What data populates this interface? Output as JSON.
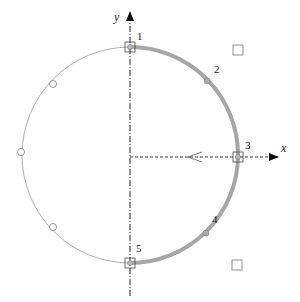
{
  "diagram": {
    "axes": {
      "x_label": "x",
      "y_label": "y"
    },
    "circle": {
      "cx": 130,
      "cy": 155,
      "r": 108,
      "stroke": "#999999",
      "highlight_stroke": "#a6a6a6"
    },
    "points": [
      {
        "label": "1",
        "x": 130,
        "y": 22
      },
      {
        "label": "2",
        "x": 207,
        "y": 79
      },
      {
        "label": "3",
        "x": 238,
        "y": 157
      },
      {
        "label": "4",
        "x": 206,
        "y": 232
      },
      {
        "label": "5",
        "x": 130,
        "y": 262
      }
    ],
    "open_circles": [
      {
        "x": 53,
        "y": 84
      },
      {
        "x": 21,
        "y": 152
      },
      {
        "x": 53,
        "y": 227
      }
    ],
    "squares": [
      {
        "x": 238,
        "y": 50
      },
      {
        "x": 237,
        "y": 265
      }
    ]
  }
}
